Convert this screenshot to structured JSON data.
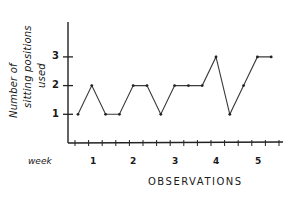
{
  "chart_data": {
    "type": "line",
    "title": "",
    "ylabel": "Number of sitting positions used",
    "ylabel_lines": [
      "Number of",
      "sitting positions",
      "used"
    ],
    "xlabel": "OBSERVATIONS",
    "x_group_label": "week",
    "x_group_ticks": [
      "1",
      "2",
      "3",
      "4",
      "5"
    ],
    "y_ticks": [
      1,
      2,
      3
    ],
    "ylim": [
      0,
      3.5
    ],
    "grid": false,
    "legend": null,
    "x": [
      1,
      2,
      3,
      4,
      5,
      6,
      7,
      8,
      9,
      10,
      11,
      12,
      13,
      14,
      15
    ],
    "values": [
      1,
      2,
      1,
      1,
      2,
      2,
      1,
      2,
      2,
      2,
      3,
      1,
      2,
      3,
      3
    ],
    "line_color": "#3a3a3a",
    "style": "hand-drawn"
  }
}
